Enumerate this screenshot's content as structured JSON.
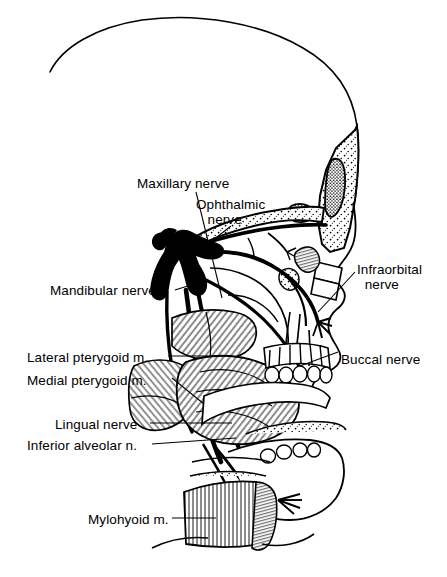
{
  "figure": {
    "background_color": "#ffffff",
    "ink_color": "#000000",
    "width": 447,
    "height": 577
  },
  "labels": [
    {
      "id": "maxillary-nerve",
      "text": "Maxillary nerve",
      "x": 137,
      "y": 176
    },
    {
      "id": "ophthalmic-nerve",
      "text": "Ophthalmic\n   nerve",
      "x": 196,
      "y": 197
    },
    {
      "id": "mandibular-nerve",
      "text": "Mandibular nerve",
      "x": 50,
      "y": 283
    },
    {
      "id": "infraorbital-nerve",
      "text": "Infraorbital\n  nerve",
      "x": 357,
      "y": 262
    },
    {
      "id": "lateral-pterygoid-muscle",
      "text": "Lateral pterygoid m.",
      "x": 27,
      "y": 350
    },
    {
      "id": "medial-pterygoid-muscle",
      "text": "Medial pterygoid m.",
      "x": 27,
      "y": 373
    },
    {
      "id": "buccal-nerve",
      "text": "Buccal nerve",
      "x": 341,
      "y": 352
    },
    {
      "id": "lingual-nerve",
      "text": "Lingual nerve",
      "x": 55,
      "y": 417
    },
    {
      "id": "inferior-alveolar-nerve",
      "text": "Inferior alveolar n.",
      "x": 27,
      "y": 438
    },
    {
      "id": "mylohyoid-muscle",
      "text": "Mylohyoid m.",
      "x": 88,
      "y": 512
    }
  ]
}
